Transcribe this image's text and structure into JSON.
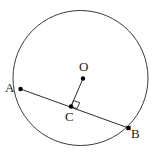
{
  "figure": {
    "kind": "geometry-diagram",
    "width": 156,
    "height": 154,
    "background_color": "#ffffff",
    "stroke_color": "#3a3a3a",
    "chord_color": "#2b2b2b",
    "label_color": "#1a1a1a",
    "dot_color": "#000000"
  },
  "circle": {
    "name": "circle",
    "cx": 80.5,
    "cy": 78,
    "r": 67.5,
    "stroke_width": 1
  },
  "points": [
    {
      "id": "A",
      "label": "A",
      "x": 20.5,
      "y": 89,
      "label_x": 5,
      "label_y": 81,
      "dot_radius": 2.2
    },
    {
      "id": "O",
      "label": "O",
      "x": 83,
      "y": 78.5,
      "label_x": 79,
      "label_y": 60,
      "dot_radius": 2.2
    },
    {
      "id": "C",
      "label": "C",
      "x": 71,
      "y": 106.5,
      "label_x": 65,
      "label_y": 110,
      "dot_radius": 2.2
    },
    {
      "id": "B",
      "label": "B",
      "x": 128.5,
      "y": 128,
      "label_x": 131,
      "label_y": 127,
      "dot_radius": 2.2
    }
  ],
  "segments": [
    {
      "id": "chord-AB",
      "label": "AB",
      "x1": 20.5,
      "y1": 89,
      "x2": 128.5,
      "y2": 128,
      "stroke_width": 1
    },
    {
      "id": "radius-OC",
      "label": "OC",
      "x1": 83,
      "y1": 78.5,
      "x2": 71,
      "y2": 106.5,
      "stroke_width": 1
    }
  ],
  "right_angle": {
    "id": "right-angle-at-C",
    "vertex_x": 71,
    "vertex_y": 106.5,
    "size": 6.5,
    "points": "71,106.5 77,104.3 79.2,110.1 73.2,112.3"
  },
  "labels": {
    "A": "A",
    "B": "B",
    "C": "C",
    "O": "O"
  }
}
